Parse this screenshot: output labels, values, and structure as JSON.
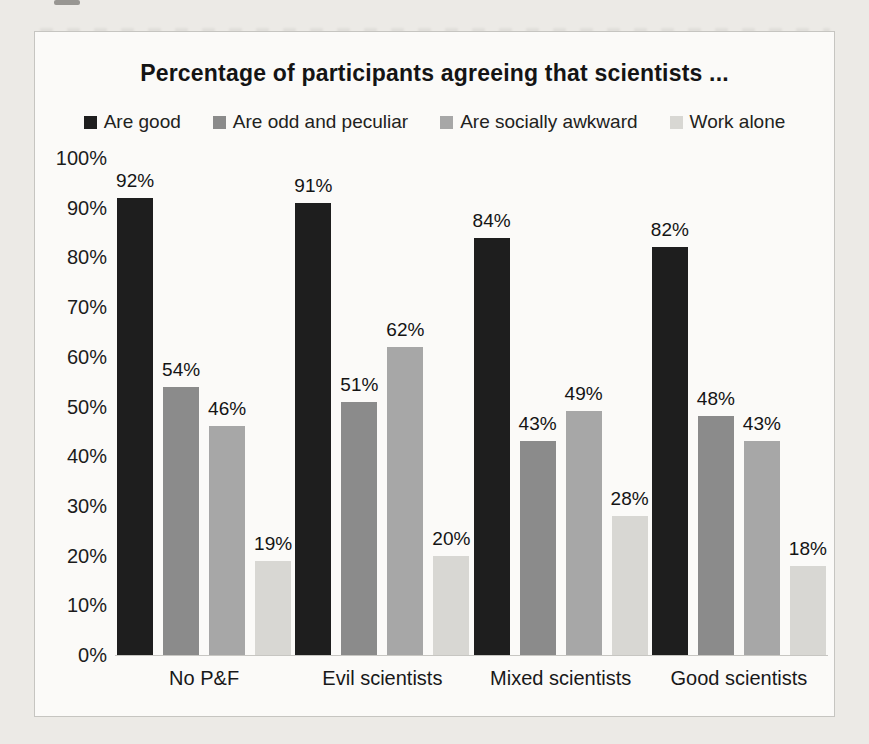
{
  "page": {
    "background_color": "#eceae6",
    "chart_background_color": "#fbfaf8",
    "chart_border_color": "#c6c5c1"
  },
  "chart_data": {
    "type": "bar",
    "title": "Percentage of participants agreeing that scientists ...",
    "categories": [
      "No P&F",
      "Evil scientists",
      "Mixed scientists",
      "Good scientists"
    ],
    "series": [
      {
        "name": "Are good",
        "color": "#1e1e1e",
        "values": [
          92,
          91,
          84,
          82
        ]
      },
      {
        "name": "Are odd and peculiar",
        "color": "#8b8b8b",
        "values": [
          54,
          51,
          43,
          48
        ]
      },
      {
        "name": "Are socially awkward",
        "color": "#a7a7a7",
        "values": [
          46,
          62,
          49,
          43
        ]
      },
      {
        "name": "Work alone",
        "color": "#d8d7d3",
        "values": [
          19,
          20,
          28,
          18
        ]
      }
    ],
    "yticks": [
      "100%",
      "90%",
      "80%",
      "70%",
      "60%",
      "50%",
      "40%",
      "30%",
      "20%",
      "10%",
      "0%"
    ],
    "ylim": [
      0,
      100
    ],
    "data_label_suffix": "%",
    "grid": false,
    "legend_position": "top",
    "data_labels": true,
    "xlabel": "",
    "ylabel": ""
  }
}
